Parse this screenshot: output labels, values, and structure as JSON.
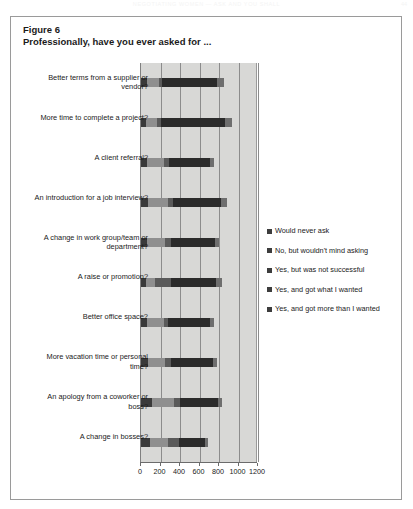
{
  "running_head": {
    "text": "NEGOTIATING WOMEN — ASK AND YOU SHALL",
    "page": "44"
  },
  "figure": {
    "number": "Figure 6",
    "subtitle": "Professionally, have you ever asked for ..."
  },
  "legend": {
    "items": [
      {
        "label": "Would never ask",
        "color": "#3d3d3d"
      },
      {
        "label": "No, but wouldn't mind asking",
        "color": "#3d3d3d"
      },
      {
        "label": "Yes, but was not successful",
        "color": "#3d3d3d"
      },
      {
        "label": "Yes, and got what I wanted",
        "color": "#3d3d3d"
      },
      {
        "label": "Yes, and got more than I wanted",
        "color": "#3d3d3d"
      }
    ]
  },
  "chart_data": {
    "type": "bar",
    "orientation": "horizontal",
    "stacked": true,
    "title": "Professionally, have you ever asked for ...",
    "xlabel": "",
    "ylabel": "",
    "xlim": [
      0,
      1200
    ],
    "xticks": [
      0,
      200,
      400,
      600,
      800,
      1000,
      1200
    ],
    "xticklabels": [
      "0",
      "200",
      "400",
      "600",
      "800",
      "1000",
      "1200"
    ],
    "grid": true,
    "legend_position": "right",
    "series_colors": [
      "#3a3a3a",
      "#8f8f8f",
      "#5a5a5a",
      "#2b2b2b",
      "#6e6e6e"
    ],
    "categories": [
      "Better terms from a supplier or vendor?",
      "More time to complete a project?",
      "A client referral?",
      "An introduction for a job interview?",
      "A change in work group/team or department?",
      "A raise or promotion?",
      "Better office space?",
      "More vacation time or personal time?",
      "An apology from a coworker or boss?",
      "A change in bosses?"
    ],
    "series": [
      {
        "name": "Would never ask",
        "values": [
          60,
          55,
          60,
          75,
          60,
          55,
          60,
          70,
          110,
          90
        ]
      },
      {
        "name": "No, but wouldn't mind asking",
        "values": [
          120,
          105,
          175,
          200,
          190,
          90,
          175,
          175,
          230,
          190
        ]
      },
      {
        "name": "Yes, but was not successful",
        "values": [
          40,
          45,
          55,
          50,
          55,
          165,
          45,
          65,
          60,
          110
        ]
      },
      {
        "name": "Yes, and got what I wanted",
        "values": [
          560,
          660,
          420,
          500,
          450,
          460,
          430,
          425,
          390,
          265
        ]
      },
      {
        "name": "Yes, and got more than I wanted",
        "values": [
          70,
          65,
          40,
          55,
          45,
          60,
          40,
          45,
          45,
          35
        ]
      }
    ]
  }
}
